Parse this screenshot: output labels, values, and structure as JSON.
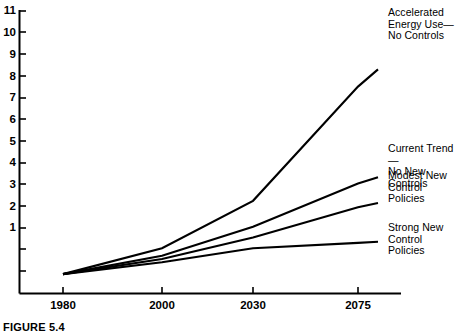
{
  "figure": {
    "caption": "FIGURE 5.4"
  },
  "chart_data": {
    "type": "line",
    "title": "",
    "subtitle": "",
    "xlabel": "",
    "ylabel": "",
    "x": [
      1980,
      2000,
      2030,
      2075,
      2090
    ],
    "xtick_labels": [
      "1980",
      "2000",
      "2030",
      "2075"
    ],
    "xtick_values": [
      1980,
      2000,
      2030,
      2075
    ],
    "ytick_labels": [
      "1",
      "2",
      "3",
      "4",
      "5",
      "6",
      "7",
      "8",
      "9",
      "10",
      "11"
    ],
    "ytick_values": [
      1,
      2,
      3,
      4,
      5,
      6,
      7,
      8,
      9,
      10,
      11
    ],
    "xlim": [
      1968,
      2100
    ],
    "ylim": [
      0,
      11
    ],
    "grid": false,
    "legend_position": "right-inline-annotations",
    "line_color": "#000000",
    "series": [
      {
        "name": "Accelerated Energy Use—No Controls",
        "label": "Accelerated\nEnergy Use—\nNo Controls",
        "values": [
          0.9,
          2.1,
          4.3,
          9.6,
          10.4
        ]
      },
      {
        "name": "Current Trend—No New Controls",
        "label": "Current Trend—\nNo New Controls",
        "values": [
          0.9,
          1.75,
          3.1,
          5.1,
          5.4
        ]
      },
      {
        "name": "Modest New Control Policies",
        "label": "Modest New\nControl\nPolicies",
        "values": [
          0.9,
          1.6,
          2.6,
          4.0,
          4.2
        ]
      },
      {
        "name": "Strong New Control Policies",
        "label": "Strong New\nControl\nPolicies",
        "values": [
          0.9,
          1.45,
          2.1,
          2.35,
          2.4
        ]
      }
    ]
  }
}
